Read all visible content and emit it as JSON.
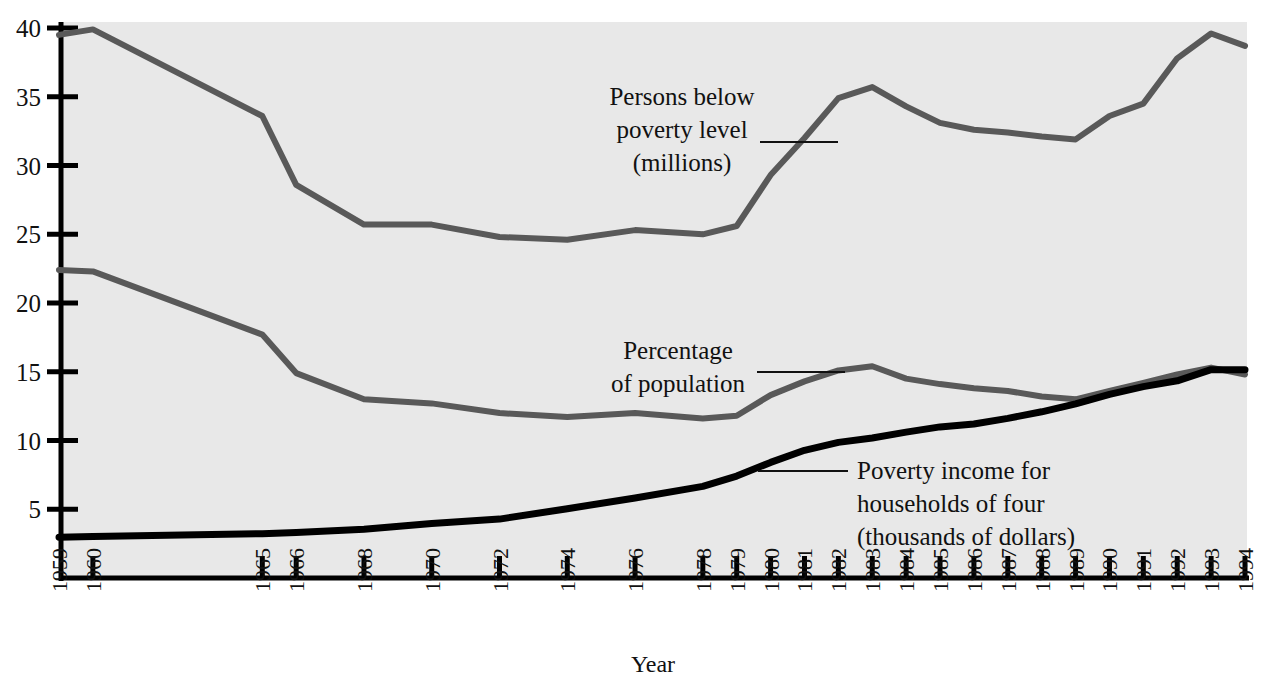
{
  "chart_data": {
    "type": "line",
    "title": "",
    "xlabel": "Year",
    "ylabel": "",
    "grid": false,
    "legend_position": "inline-annotations",
    "xlim": [
      1959,
      1994
    ],
    "ylim": [
      0,
      40
    ],
    "y_ticks": [
      5,
      10,
      15,
      20,
      25,
      30,
      35,
      40
    ],
    "y_tick_labels": [
      "5",
      "10",
      "15",
      "20",
      "25",
      "30",
      "35",
      "40"
    ],
    "x_tick_labels": [
      "1959",
      "1960",
      "1965",
      "1966",
      "1968",
      "1970",
      "1972",
      "1974",
      "1976",
      "1978",
      "1979",
      "1980",
      "1981",
      "1982",
      "1983",
      "1984",
      "1985",
      "1986",
      "1987",
      "1988",
      "1989",
      "1990",
      "1991",
      "1992",
      "1993",
      "1994"
    ],
    "x": [
      1959,
      1960,
      1965,
      1966,
      1968,
      1970,
      1972,
      1974,
      1976,
      1978,
      1979,
      1980,
      1981,
      1982,
      1983,
      1984,
      1985,
      1986,
      1987,
      1988,
      1989,
      1990,
      1991,
      1992,
      1993,
      1994
    ],
    "series": [
      {
        "name": "Persons below poverty level (millions)",
        "color": "#595959",
        "width": 6,
        "values": [
          39.5,
          39.9,
          33.6,
          28.6,
          25.7,
          25.7,
          24.8,
          24.6,
          25.3,
          25.0,
          25.6,
          29.3,
          32.0,
          34.9,
          35.7,
          34.3,
          33.1,
          32.6,
          32.4,
          32.1,
          31.9,
          33.6,
          34.5,
          37.8,
          39.6,
          38.7
        ]
      },
      {
        "name": "Percentage of population",
        "color": "#595959",
        "width": 6,
        "values": [
          22.4,
          22.3,
          17.7,
          14.9,
          13.0,
          12.7,
          12.0,
          11.7,
          12.0,
          11.6,
          11.8,
          13.3,
          14.3,
          15.1,
          15.4,
          14.5,
          14.1,
          13.8,
          13.6,
          13.2,
          13.0,
          13.6,
          14.2,
          14.8,
          15.3,
          14.8
        ]
      },
      {
        "name": "Poverty income for households of four (thousands of dollars)",
        "color": "#000000",
        "width": 7,
        "values": [
          2.97,
          3.02,
          3.22,
          3.32,
          3.55,
          3.97,
          4.28,
          5.04,
          5.82,
          6.66,
          7.41,
          8.41,
          9.29,
          9.86,
          10.18,
          10.61,
          10.99,
          11.2,
          11.61,
          12.09,
          12.67,
          13.36,
          13.92,
          14.34,
          15.15,
          15.15
        ]
      }
    ],
    "annotations": [
      {
        "id": "persons-below-poverty-level",
        "lines": [
          "Persons below",
          "poverty level",
          "(millions)"
        ],
        "leader": true
      },
      {
        "id": "percentage-of-population",
        "lines": [
          "Percentage",
          "of population"
        ],
        "leader": true
      },
      {
        "id": "poverty-income-households-of-four",
        "lines": [
          "Poverty income for",
          "households of four",
          "(thousands of dollars)"
        ],
        "leader": true
      }
    ],
    "colors": {
      "plot_background": "#e8e8e8",
      "axis": "#000000",
      "gray_series": "#595959",
      "black_series": "#000000",
      "text": "#111111"
    }
  }
}
